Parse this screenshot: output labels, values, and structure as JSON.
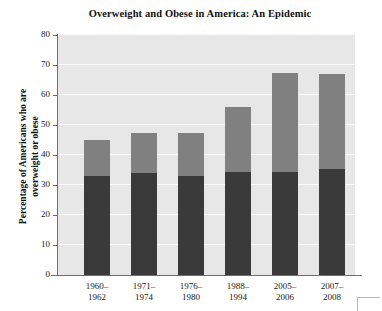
{
  "chart_data": {
    "type": "bar",
    "title": "Overweight and Obese in America: An Epidemic",
    "xlabel": "",
    "ylabel": "Percentage of Americans who are overweight or obese",
    "ylabel_lines": [
      "Percentage of Americans who are",
      "overweight or obese"
    ],
    "categories": [
      "1960–1962",
      "1971–1974",
      "1976–1980",
      "1988–1994",
      "2005–2006",
      "2007–2008"
    ],
    "category_lines": [
      [
        "1960–",
        "1962"
      ],
      [
        "1971–",
        "1974"
      ],
      [
        "1976–",
        "1980"
      ],
      [
        "1988–",
        "1994"
      ],
      [
        "2005–",
        "2006"
      ],
      [
        "2007–",
        "2008"
      ]
    ],
    "stacked": true,
    "series": [
      {
        "name": "Obese",
        "color": "#3a3a3a",
        "values": [
          33,
          34,
          33,
          34.5,
          34.5,
          35.5
        ]
      },
      {
        "name": "Overweight (not obese)",
        "color": "#808080",
        "values": [
          12,
          13.5,
          14.5,
          21.5,
          33,
          31.5
        ]
      }
    ],
    "totals": [
      45,
      47.5,
      47.5,
      56,
      67.5,
      67
    ],
    "ylim": [
      0,
      80
    ],
    "yticks": [
      0,
      10,
      20,
      30,
      40,
      50,
      60,
      70,
      80
    ],
    "ytick_labels": [
      "0",
      "10",
      "20",
      "30",
      "40",
      "50",
      "60",
      "70",
      "80"
    ],
    "grid": true,
    "grid_color": "#fafafa",
    "plot_background": "#e7e7e7",
    "legend": null,
    "legend_position": "none"
  }
}
